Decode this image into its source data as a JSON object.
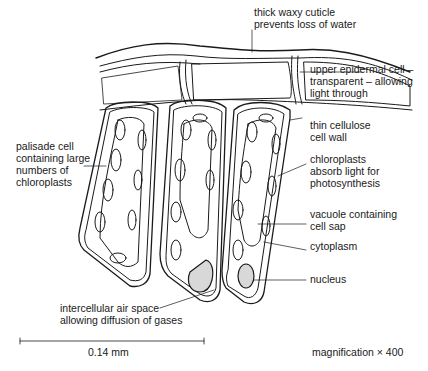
{
  "labels": {
    "cuticle": "thick waxy cuticle\nprevents loss of water",
    "epidermal": "upper epidermal cell –\ntransparent – allowing\nlight through",
    "palisade": "palisade cell\ncontaining large\nnumbers of\nchloroplasts",
    "cell_wall": "thin cellulose\ncell wall",
    "chloroplasts": "chloroplasts\nabsorb light for\nphotosynthesis",
    "vacuole": "vacuole containing\ncell sap",
    "cytoplasm": "cytoplasm",
    "nucleus": "nucleus",
    "air_space": "intercellular air space\nallowing diffusion of gases"
  },
  "scale_bar": {
    "label": "0.14 mm"
  },
  "magnification": "magnification × 400",
  "colors": {
    "line": "#1a1a1a",
    "background": "#ffffff"
  }
}
